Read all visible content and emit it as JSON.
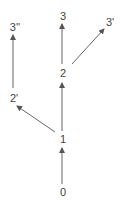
{
  "diagram": {
    "nodes": [
      {
        "id": "n0",
        "label": "0",
        "x": 63,
        "y": 192
      },
      {
        "id": "n1",
        "label": "1",
        "x": 63,
        "y": 139
      },
      {
        "id": "n2",
        "label": "2",
        "x": 63,
        "y": 73
      },
      {
        "id": "n3",
        "label": "3",
        "x": 63,
        "y": 16
      },
      {
        "id": "n3p",
        "label": "3'",
        "x": 109,
        "y": 22
      },
      {
        "id": "n2p",
        "label": "2'",
        "x": 13,
        "y": 98
      },
      {
        "id": "n3pp",
        "label": "3''",
        "x": 13,
        "y": 27
      }
    ],
    "edges": [
      {
        "from": "0",
        "to": "1"
      },
      {
        "from": "1",
        "to": "2"
      },
      {
        "from": "2",
        "to": "3"
      },
      {
        "from": "2",
        "to": "3'"
      },
      {
        "from": "1",
        "to": "2'"
      },
      {
        "from": "2'",
        "to": "3''"
      }
    ],
    "line_color": "#555555"
  }
}
